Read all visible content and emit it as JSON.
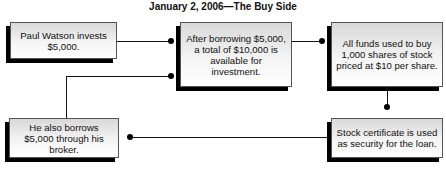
{
  "title": "January 2, 2006—The Buy Side",
  "nodes": [
    {
      "id": "invest",
      "text": "Paul Watson invests $5,000."
    },
    {
      "id": "total",
      "text": "After borrowing $5,000, a total of $10,000 is available for investment."
    },
    {
      "id": "buy",
      "text": "All funds used to buy 1,000 shares of stock priced at $10 per share."
    },
    {
      "id": "borrow",
      "text": "He also borrows $5,000 through his broker."
    },
    {
      "id": "certificate",
      "text": "Stock certificate is used as security for the loan."
    }
  ],
  "edges": [
    {
      "from": "invest",
      "to": "total"
    },
    {
      "from": "borrow",
      "to": "total"
    },
    {
      "from": "total",
      "to": "buy"
    },
    {
      "from": "buy",
      "to": "certificate"
    },
    {
      "from": "certificate",
      "to": "borrow"
    }
  ]
}
